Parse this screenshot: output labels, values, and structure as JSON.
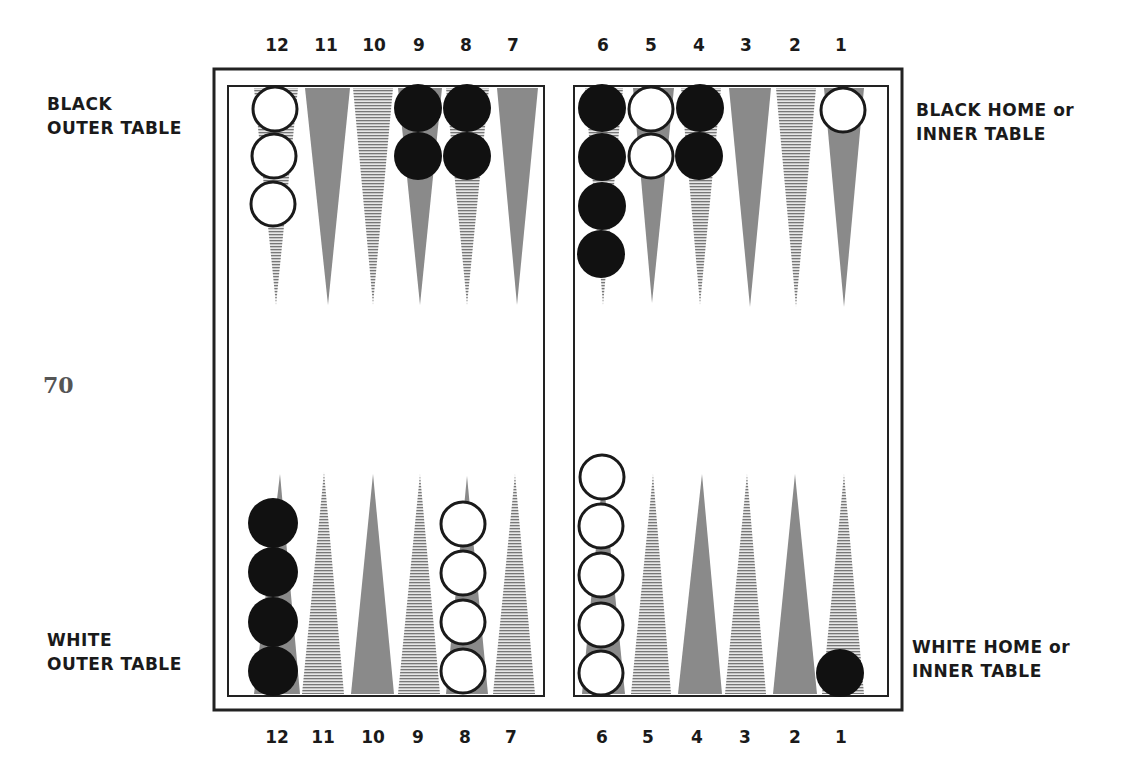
{
  "page_number": "70",
  "labels": {
    "black_outer": [
      "BLACK",
      "OUTER TABLE"
    ],
    "black_home": [
      "BLACK HOME or",
      "INNER TABLE"
    ],
    "white_outer": [
      "WHITE",
      "OUTER TABLE"
    ],
    "white_home": [
      "WHITE HOME or",
      "INNER TABLE"
    ]
  },
  "point_numbers_top": [
    "12",
    "11",
    "10",
    "9",
    "8",
    "7",
    "6",
    "5",
    "4",
    "3",
    "2",
    "1"
  ],
  "point_numbers_bottom": [
    "12",
    "11",
    "10",
    "9",
    "8",
    "7",
    "6",
    "5",
    "4",
    "3",
    "2",
    "1"
  ],
  "colors": {
    "dark_point": "#8a8a8a",
    "hatch": "#7a7a7a",
    "black_checker": "#111111",
    "white_checker": "#ffffff",
    "frame": "#222222"
  },
  "position": {
    "top": [
      {
        "point": "12",
        "checkers": "white",
        "count": 3
      },
      {
        "point": "11",
        "checkers": null,
        "count": 0
      },
      {
        "point": "10",
        "checkers": null,
        "count": 0
      },
      {
        "point": "9",
        "checkers": "black",
        "count": 2
      },
      {
        "point": "8",
        "checkers": "black",
        "count": 2
      },
      {
        "point": "7",
        "checkers": null,
        "count": 0
      },
      {
        "point": "6",
        "checkers": "black",
        "count": 4
      },
      {
        "point": "5",
        "checkers": "white",
        "count": 2
      },
      {
        "point": "4",
        "checkers": "black",
        "count": 2
      },
      {
        "point": "3",
        "checkers": null,
        "count": 0
      },
      {
        "point": "2",
        "checkers": null,
        "count": 0
      },
      {
        "point": "1",
        "checkers": "white",
        "count": 1
      }
    ],
    "bottom": [
      {
        "point": "12",
        "checkers": "black",
        "count": 4
      },
      {
        "point": "11",
        "checkers": null,
        "count": 0
      },
      {
        "point": "10",
        "checkers": null,
        "count": 0
      },
      {
        "point": "9",
        "checkers": null,
        "count": 0
      },
      {
        "point": "8",
        "checkers": "white",
        "count": 4
      },
      {
        "point": "7",
        "checkers": null,
        "count": 0
      },
      {
        "point": "6",
        "checkers": "white",
        "count": 5
      },
      {
        "point": "5",
        "checkers": null,
        "count": 0
      },
      {
        "point": "4",
        "checkers": null,
        "count": 0
      },
      {
        "point": "3",
        "checkers": null,
        "count": 0
      },
      {
        "point": "2",
        "checkers": null,
        "count": 0
      },
      {
        "point": "1",
        "checkers": "black",
        "count": 1
      }
    ]
  }
}
